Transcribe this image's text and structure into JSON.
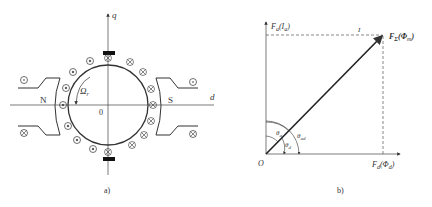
{
  "figure_a": {
    "caption": "a)",
    "q_axis_label": "q",
    "d_axis_label": "d",
    "north_pole_label": "N",
    "south_pole_label": "S",
    "origin_label": "0",
    "rotation_label": "Ω",
    "rotation_subscript": "r"
  },
  "figure_b": {
    "caption": "b)",
    "origin_label": "O",
    "y_axis_label": "F",
    "y_axis_sub": "a",
    "y_axis_paren": "I",
    "y_axis_paren_sub": "a",
    "x_axis_label": "F",
    "x_axis_sub": "d",
    "x_axis_paren": "Φ",
    "x_axis_paren_sub": "d",
    "result_label": "F",
    "result_sub": "Σ",
    "result_paren": "Φ",
    "result_paren_sub": "m",
    "top_dashed_label": "I",
    "theta_a": "θ",
    "theta_a_sub": "a",
    "theta_d": "θ",
    "theta_d_sub": "d",
    "theta_ad": "θ",
    "theta_ad_sub": "ad"
  }
}
